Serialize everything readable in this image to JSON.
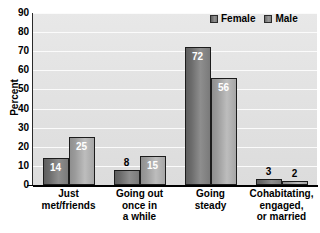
{
  "chart_data": {
    "type": "bar",
    "title": "",
    "xlabel": "",
    "ylabel": "Percent",
    "ylim": [
      0,
      90
    ],
    "ytick_step": 10,
    "yticks": [
      90,
      80,
      70,
      60,
      50,
      40,
      30,
      20,
      10,
      0
    ],
    "grid": true,
    "legend_position": "top-right",
    "categories": [
      "Just met/friends",
      "Going out once in a while",
      "Going steady",
      "Cohabitating, engaged, or married"
    ],
    "category_lines": [
      [
        "Just",
        "met/friends"
      ],
      [
        "Going out",
        "once in",
        "a while"
      ],
      [
        "Going",
        "steady"
      ],
      [
        "Cohabitating,",
        "engaged,",
        "or married"
      ]
    ],
    "series": [
      {
        "name": "Female",
        "values": [
          14,
          8,
          72,
          3
        ],
        "color": "#7a7a7a"
      },
      {
        "name": "Male",
        "values": [
          25,
          15,
          56,
          2
        ],
        "color": "#a8a8a8"
      }
    ]
  },
  "legend": {
    "items": [
      {
        "label": "Female",
        "swatch": "legend-swatch-female"
      },
      {
        "label": "Male",
        "swatch": "legend-swatch-male"
      }
    ]
  },
  "axis": {
    "y_title": "Percent"
  },
  "colors": {
    "plot_background": "#e2e2e2",
    "gridline": "#fbfbfb",
    "axis": "#000000",
    "bar_female": "#7a7a7a",
    "bar_male": "#a8a8a8",
    "label_light": "#ffffff",
    "label_dark": "#000000"
  }
}
